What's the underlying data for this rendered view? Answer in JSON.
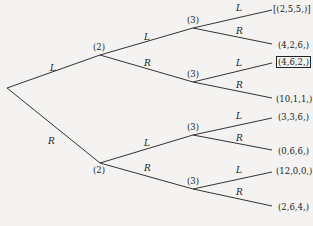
{
  "tree": {
    "root": {
      "x": 7,
      "y": 88
    },
    "level1": [
      {
        "id": "n2a",
        "label": "(2)",
        "x": 100,
        "y": 55,
        "edge_label": "L"
      },
      {
        "id": "n2b",
        "label": "(2)",
        "x": 100,
        "y": 163,
        "edge_label": "R"
      }
    ],
    "level2": [
      {
        "id": "n3a",
        "label": "(3)",
        "x": 193,
        "y": 28,
        "parent": "n2a",
        "edge_label": "L"
      },
      {
        "id": "n3b",
        "label": "(3)",
        "x": 193,
        "y": 82,
        "parent": "n2a",
        "edge_label": "R"
      },
      {
        "id": "n3c",
        "label": "(3)",
        "x": 193,
        "y": 135,
        "parent": "n2b",
        "edge_label": "L"
      },
      {
        "id": "n3d",
        "label": "(3)",
        "x": 193,
        "y": 189,
        "parent": "n2b",
        "edge_label": "R"
      }
    ],
    "leaves": [
      {
        "label": "[(2,5,5,)]",
        "parent": "n3a",
        "edge_label": "L",
        "y": 10,
        "boxed": false
      },
      {
        "label": "(4,2,6,)",
        "parent": "n3a",
        "edge_label": "R",
        "y": 46,
        "boxed": false
      },
      {
        "label": "(4,6,2,)",
        "parent": "n3b",
        "edge_label": "L",
        "y": 63,
        "boxed": true
      },
      {
        "label": "(10,1,1,)",
        "parent": "n3b",
        "edge_label": "R",
        "y": 100,
        "boxed": false
      },
      {
        "label": "(3,3,6,)",
        "parent": "n3c",
        "edge_label": "L",
        "y": 118,
        "boxed": false
      },
      {
        "label": "(0,6,6,)",
        "parent": "n3c",
        "edge_label": "R",
        "y": 152,
        "boxed": false
      },
      {
        "label": "(12,0,0,)",
        "parent": "n3d",
        "edge_label": "L",
        "y": 172,
        "boxed": false
      },
      {
        "label": "(2,6,4,)",
        "parent": "n3d",
        "edge_label": "R",
        "y": 208,
        "boxed": false
      }
    ]
  },
  "labels": {
    "root_L": "L",
    "root_R": "R",
    "n2a": "(2)",
    "n2b": "(2)",
    "n3a": "(3)",
    "n3b": "(3)",
    "n3c": "(3)",
    "n3d": "(3)",
    "e_n2a_L": "L",
    "e_n2a_R": "R",
    "e_n2b_L": "L",
    "e_n2b_R": "R",
    "e_n3a_L": "L",
    "e_n3a_R": "R",
    "e_n3b_L": "L",
    "e_n3b_R": "R",
    "e_n3c_L": "L",
    "e_n3c_R": "R",
    "e_n3d_L": "L",
    "e_n3d_R": "R",
    "leaf0": "[(2,5,5,)]",
    "leaf1": "(4,2,6,)",
    "leaf2": "(4,6,2,)",
    "leaf3": "(10,1,1,)",
    "leaf4": "(3,3,6,)",
    "leaf5": "(0,6,6,)",
    "leaf6": "(12,0,0,)",
    "leaf7": "(2,6,4,)"
  },
  "colors": {
    "line": "#333333",
    "background": "#f4f3f1"
  }
}
